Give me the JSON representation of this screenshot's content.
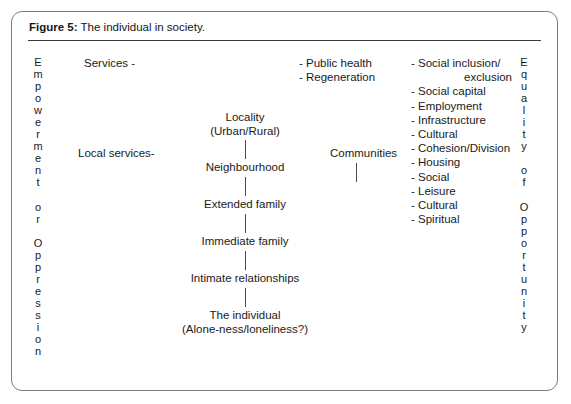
{
  "figure": {
    "caption_label": "Figure 5:",
    "caption_text": "The individual in society."
  },
  "left_column": {
    "name": "Empowerment or Oppression",
    "letters": [
      "E",
      "m",
      "p",
      "o",
      "w",
      "e",
      "r",
      "m",
      "e",
      "n",
      "t",
      "",
      "o",
      "r",
      "",
      "O",
      "p",
      "p",
      "r",
      "e",
      "s",
      "s",
      "i",
      "o",
      "n"
    ]
  },
  "right_column": {
    "name": "Equality of Opportunity",
    "letters": [
      "E",
      "q",
      "u",
      "a",
      "l",
      "i",
      "t",
      "y",
      "",
      "o",
      "f",
      "",
      "O",
      "p",
      "p",
      "o",
      "r",
      "t",
      "u",
      "n",
      "i",
      "t",
      "y"
    ]
  },
  "labels": {
    "services": "Services -",
    "local_services": "Local services-",
    "communities": "Communities"
  },
  "hierarchy": [
    {
      "line1": "Locality",
      "line2": "(Urban/Rural)"
    },
    {
      "line1": "Neighbourhood",
      "line2": ""
    },
    {
      "line1": "Extended family",
      "line2": ""
    },
    {
      "line1": "Immediate family",
      "line2": ""
    },
    {
      "line1": "Intimate relationships",
      "line2": ""
    },
    {
      "line1": "The individual",
      "line2": "(Alone-ness/loneliness?)"
    }
  ],
  "policy_list": [
    "- Public health",
    "- Regeneration"
  ],
  "themes_list": [
    {
      "text": "- Social inclusion/",
      "indent": false
    },
    {
      "text": "exclusion",
      "indent": true
    },
    {
      "text": "- Social capital",
      "indent": false
    },
    {
      "text": "- Employment",
      "indent": false
    },
    {
      "text": "- Infrastructure",
      "indent": false
    },
    {
      "text": "- Cultural",
      "indent": false
    },
    {
      "text": "- Cohesion/Division",
      "indent": false
    },
    {
      "text": "- Housing",
      "indent": false
    },
    {
      "text": "- Social",
      "indent": false
    },
    {
      "text": "- Leisure",
      "indent": false
    },
    {
      "text": "- Cultural",
      "indent": false
    },
    {
      "text": "- Spiritual",
      "indent": false
    }
  ],
  "colors": {
    "border": "#7d7d7d",
    "rule": "#3a3a3a",
    "text": "#1a1a1a",
    "connector": "#4a4a4a",
    "background": "#ffffff"
  }
}
